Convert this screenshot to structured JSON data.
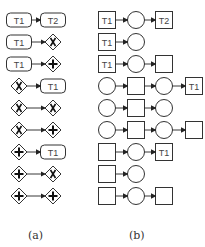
{
  "panels": {
    "a": {
      "label": "(a)",
      "rows": [
        [
          {
            "type": "task",
            "text": "T1"
          },
          {
            "type": "task",
            "text": "T2"
          }
        ],
        [
          {
            "type": "task",
            "text": "T1"
          },
          {
            "type": "xor"
          }
        ],
        [
          {
            "type": "task",
            "text": "T1"
          },
          {
            "type": "and"
          }
        ],
        [
          {
            "type": "xor"
          },
          {
            "type": "task",
            "text": "T1"
          }
        ],
        [
          {
            "type": "xor"
          },
          {
            "type": "xor"
          }
        ],
        [
          {
            "type": "xor"
          },
          {
            "type": "and"
          }
        ],
        [
          {
            "type": "and"
          },
          {
            "type": "task",
            "text": "T1"
          }
        ],
        [
          {
            "type": "and"
          },
          {
            "type": "xor"
          }
        ],
        [
          {
            "type": "and"
          },
          {
            "type": "and"
          }
        ]
      ]
    },
    "b": {
      "label": "(b)",
      "rows": [
        [
          {
            "type": "transition",
            "text": "T1"
          },
          {
            "type": "place"
          },
          {
            "type": "transition",
            "text": "T2"
          }
        ],
        [
          {
            "type": "transition",
            "text": "T1"
          },
          {
            "type": "place"
          }
        ],
        [
          {
            "type": "transition",
            "text": "T1"
          },
          {
            "type": "place"
          },
          {
            "type": "transition"
          }
        ],
        [
          {
            "type": "place"
          },
          {
            "type": "transition"
          },
          {
            "type": "place"
          },
          {
            "type": "transition",
            "text": "T1"
          }
        ],
        [
          {
            "type": "place"
          },
          {
            "type": "transition"
          },
          {
            "type": "place"
          }
        ],
        [
          {
            "type": "place"
          },
          {
            "type": "transition"
          },
          {
            "type": "place"
          },
          {
            "type": "transition"
          }
        ],
        [
          {
            "type": "transition"
          },
          {
            "type": "place"
          },
          {
            "type": "transition",
            "text": "T1"
          }
        ],
        [
          {
            "type": "transition"
          },
          {
            "type": "place"
          }
        ],
        [
          {
            "type": "transition"
          },
          {
            "type": "place"
          },
          {
            "type": "transition"
          }
        ]
      ]
    }
  },
  "colors": {
    "stroke": "#333333",
    "text": "#444444"
  }
}
